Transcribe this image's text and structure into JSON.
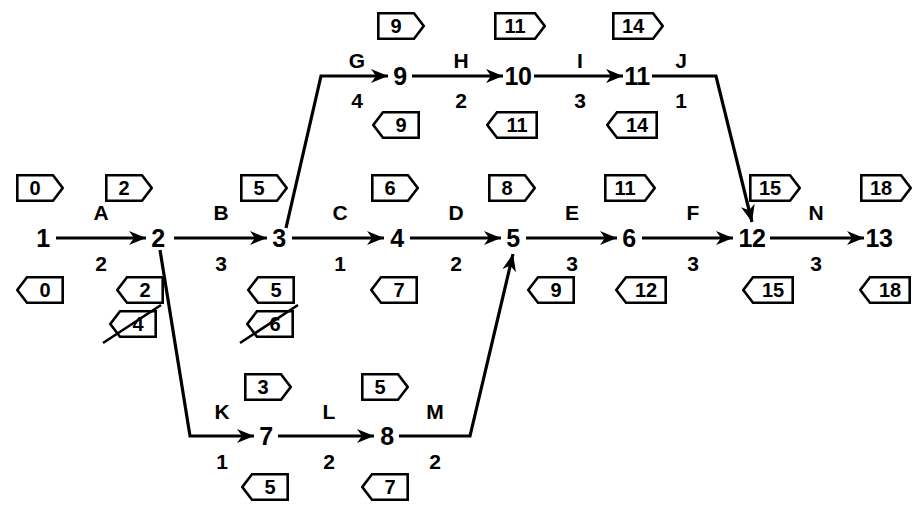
{
  "diagram": {
    "type": "activity-on-arrow-network",
    "colors": {
      "ink": "#000000",
      "paper": "#ffffff"
    }
  },
  "nodes": [
    {
      "id": "n1",
      "label": "1",
      "x": 43,
      "y": 238
    },
    {
      "id": "n2",
      "label": "2",
      "x": 158,
      "y": 238
    },
    {
      "id": "n3",
      "label": "3",
      "x": 279,
      "y": 238
    },
    {
      "id": "n4",
      "label": "4",
      "x": 397,
      "y": 238
    },
    {
      "id": "n5",
      "label": "5",
      "x": 513,
      "y": 238
    },
    {
      "id": "n6",
      "label": "6",
      "x": 629,
      "y": 238
    },
    {
      "id": "n12",
      "label": "12",
      "x": 752,
      "y": 238
    },
    {
      "id": "n13",
      "label": "13",
      "x": 879,
      "y": 238
    },
    {
      "id": "n9",
      "label": "9",
      "x": 400,
      "y": 76
    },
    {
      "id": "n10",
      "label": "10",
      "x": 518,
      "y": 76
    },
    {
      "id": "n11",
      "label": "11",
      "x": 637,
      "y": 76
    },
    {
      "id": "n7",
      "label": "7",
      "x": 266,
      "y": 436
    },
    {
      "id": "n8",
      "label": "8",
      "x": 387,
      "y": 436
    }
  ],
  "activities": [
    {
      "id": "A",
      "name": "A",
      "duration": "2",
      "from": "1",
      "to": "2",
      "name_x": 101,
      "name_y": 212,
      "dur_x": 101,
      "dur_y": 263
    },
    {
      "id": "B",
      "name": "B",
      "duration": "3",
      "from": "2",
      "to": "3",
      "name_x": 221,
      "name_y": 212,
      "dur_x": 221,
      "dur_y": 263
    },
    {
      "id": "C",
      "name": "C",
      "duration": "1",
      "from": "3",
      "to": "4",
      "name_x": 340,
      "name_y": 212,
      "dur_x": 340,
      "dur_y": 263
    },
    {
      "id": "D",
      "name": "D",
      "duration": "2",
      "from": "4",
      "to": "5",
      "name_x": 456,
      "name_y": 212,
      "dur_x": 456,
      "dur_y": 263
    },
    {
      "id": "E",
      "name": "E",
      "duration": "3",
      "from": "5",
      "to": "6",
      "name_x": 572,
      "name_y": 212,
      "dur_x": 572,
      "dur_y": 263
    },
    {
      "id": "F",
      "name": "F",
      "duration": "3",
      "from": "6",
      "to": "12",
      "name_x": 693,
      "name_y": 212,
      "dur_x": 693,
      "dur_y": 263
    },
    {
      "id": "N",
      "name": "N",
      "duration": "3",
      "from": "12",
      "to": "13",
      "name_x": 816,
      "name_y": 212,
      "dur_x": 816,
      "dur_y": 263
    },
    {
      "id": "G",
      "name": "G",
      "duration": "4",
      "from": "3",
      "to": "9",
      "name_x": 357,
      "name_y": 60,
      "dur_x": 357,
      "dur_y": 100
    },
    {
      "id": "H",
      "name": "H",
      "duration": "2",
      "from": "9",
      "to": "10",
      "name_x": 461,
      "name_y": 60,
      "dur_x": 461,
      "dur_y": 100
    },
    {
      "id": "I",
      "name": "I",
      "duration": "3",
      "from": "10",
      "to": "11",
      "name_x": 580,
      "name_y": 60,
      "dur_x": 580,
      "dur_y": 100
    },
    {
      "id": "J",
      "name": "J",
      "duration": "1",
      "from": "11",
      "to": "12",
      "name_x": 681,
      "name_y": 60,
      "dur_x": 681,
      "dur_y": 100
    },
    {
      "id": "K",
      "name": "K",
      "duration": "1",
      "from": "2",
      "to": "7",
      "name_x": 222,
      "name_y": 411,
      "dur_x": 222,
      "dur_y": 461
    },
    {
      "id": "L",
      "name": "L",
      "duration": "2",
      "from": "7",
      "to": "8",
      "name_x": 329,
      "name_y": 411,
      "dur_x": 329,
      "dur_y": 461
    },
    {
      "id": "M",
      "name": "M",
      "duration": "2",
      "from": "8",
      "to": "5",
      "name_x": 435,
      "name_y": 411,
      "dur_x": 435,
      "dur_y": 461
    }
  ],
  "tags": [
    {
      "id": "t-e1",
      "value": "0",
      "dir": "forward",
      "struck": false,
      "x": 40,
      "y": 188,
      "w": 48,
      "h": 28
    },
    {
      "id": "t-e2",
      "value": "2",
      "dir": "forward",
      "struck": false,
      "x": 129,
      "y": 188,
      "w": 48,
      "h": 28
    },
    {
      "id": "t-e3",
      "value": "5",
      "dir": "forward",
      "struck": false,
      "x": 264,
      "y": 188,
      "w": 48,
      "h": 28
    },
    {
      "id": "t-e4",
      "value": "6",
      "dir": "forward",
      "struck": false,
      "x": 395,
      "y": 188,
      "w": 48,
      "h": 28
    },
    {
      "id": "t-e5",
      "value": "8",
      "dir": "forward",
      "struck": false,
      "x": 512,
      "y": 188,
      "w": 48,
      "h": 28
    },
    {
      "id": "t-e6",
      "value": "11",
      "dir": "forward",
      "struck": false,
      "x": 630,
      "y": 188,
      "w": 52,
      "h": 28
    },
    {
      "id": "t-e12",
      "value": "15",
      "dir": "forward",
      "struck": false,
      "x": 775,
      "y": 188,
      "w": 52,
      "h": 28
    },
    {
      "id": "t-e13",
      "value": "18",
      "dir": "forward",
      "struck": false,
      "x": 886,
      "y": 188,
      "w": 52,
      "h": 28
    },
    {
      "id": "t-l1",
      "value": "0",
      "dir": "backward",
      "struck": false,
      "x": 40,
      "y": 290,
      "w": 48,
      "h": 28
    },
    {
      "id": "t-l2",
      "value": "2",
      "dir": "backward",
      "struck": false,
      "x": 140,
      "y": 290,
      "w": 48,
      "h": 28
    },
    {
      "id": "t-l3",
      "value": "5",
      "dir": "backward",
      "struck": false,
      "x": 271,
      "y": 290,
      "w": 48,
      "h": 28
    },
    {
      "id": "t-l4",
      "value": "7",
      "dir": "backward",
      "struck": false,
      "x": 394,
      "y": 290,
      "w": 48,
      "h": 28
    },
    {
      "id": "t-l5",
      "value": "9",
      "dir": "backward",
      "struck": false,
      "x": 551,
      "y": 290,
      "w": 48,
      "h": 28
    },
    {
      "id": "t-l6",
      "value": "12",
      "dir": "backward",
      "struck": false,
      "x": 641,
      "y": 290,
      "w": 52,
      "h": 28
    },
    {
      "id": "t-l12",
      "value": "15",
      "dir": "backward",
      "struck": false,
      "x": 768,
      "y": 290,
      "w": 52,
      "h": 28
    },
    {
      "id": "t-l13",
      "value": "18",
      "dir": "backward",
      "struck": false,
      "x": 885,
      "y": 290,
      "w": 52,
      "h": 28
    },
    {
      "id": "t-l2x",
      "value": "4",
      "dir": "backward",
      "struck": true,
      "x": 133,
      "y": 324,
      "w": 48,
      "h": 28
    },
    {
      "id": "t-l3x",
      "value": "6",
      "dir": "backward",
      "struck": true,
      "x": 270,
      "y": 324,
      "w": 48,
      "h": 28
    },
    {
      "id": "t-e9",
      "value": "9",
      "dir": "forward",
      "struck": false,
      "x": 401,
      "y": 26,
      "w": 48,
      "h": 28
    },
    {
      "id": "t-e10",
      "value": "11",
      "dir": "forward",
      "struck": false,
      "x": 520,
      "y": 26,
      "w": 52,
      "h": 28
    },
    {
      "id": "t-e11",
      "value": "14",
      "dir": "forward",
      "struck": false,
      "x": 638,
      "y": 26,
      "w": 52,
      "h": 28
    },
    {
      "id": "t-l9",
      "value": "9",
      "dir": "backward",
      "struck": false,
      "x": 396,
      "y": 125,
      "w": 48,
      "h": 28
    },
    {
      "id": "t-l10",
      "value": "11",
      "dir": "backward",
      "struck": false,
      "x": 512,
      "y": 125,
      "w": 52,
      "h": 28
    },
    {
      "id": "t-l11",
      "value": "14",
      "dir": "backward",
      "struck": false,
      "x": 632,
      "y": 125,
      "w": 52,
      "h": 28
    },
    {
      "id": "t-e7",
      "value": "3",
      "dir": "forward",
      "struck": false,
      "x": 268,
      "y": 387,
      "w": 48,
      "h": 28
    },
    {
      "id": "t-e8",
      "value": "5",
      "dir": "forward",
      "struck": false,
      "x": 385,
      "y": 387,
      "w": 48,
      "h": 28
    },
    {
      "id": "t-l7",
      "value": "5",
      "dir": "backward",
      "struck": false,
      "x": 265,
      "y": 487,
      "w": 48,
      "h": 28
    },
    {
      "id": "t-l8",
      "value": "7",
      "dir": "backward",
      "struck": false,
      "x": 385,
      "y": 487,
      "w": 48,
      "h": 28
    }
  ],
  "edges": [
    {
      "id": "e-A",
      "path": "M 56 238 L 146 238",
      "arrow": true,
      "arrow_at": [
        146,
        238
      ],
      "angle": 0
    },
    {
      "id": "e-B",
      "path": "M 174 238 L 267 238",
      "arrow": true,
      "arrow_at": [
        267,
        238
      ],
      "angle": 0
    },
    {
      "id": "e-C",
      "path": "M 292 238 L 384 238",
      "arrow": true,
      "arrow_at": [
        384,
        238
      ],
      "angle": 0
    },
    {
      "id": "e-D",
      "path": "M 410 238 L 501 238",
      "arrow": true,
      "arrow_at": [
        501,
        238
      ],
      "angle": 0
    },
    {
      "id": "e-E",
      "path": "M 526 238 L 617 238",
      "arrow": true,
      "arrow_at": [
        617,
        238
      ],
      "angle": 0
    },
    {
      "id": "e-F",
      "path": "M 642 238 L 733 238",
      "arrow": true,
      "arrow_at": [
        733,
        238
      ],
      "angle": 0
    },
    {
      "id": "e-N",
      "path": "M 770 238 L 864 238",
      "arrow": true,
      "arrow_at": [
        864,
        238
      ],
      "angle": 0
    },
    {
      "id": "e-G",
      "path": "M 286 228 L 321 76 L 388 76",
      "arrow": true,
      "arrow_at": [
        388,
        76
      ],
      "angle": 0
    },
    {
      "id": "e-H",
      "path": "M 412 76 L 503 76",
      "arrow": true,
      "arrow_at": [
        503,
        76
      ],
      "angle": 0
    },
    {
      "id": "e-I",
      "path": "M 534 76 L 623 76",
      "arrow": true,
      "arrow_at": [
        623,
        76
      ],
      "angle": 0
    },
    {
      "id": "e-J",
      "path": "M 652 76 L 716 76 L 752 222",
      "arrow": true,
      "arrow_at": [
        752,
        222
      ],
      "angle": 76
    },
    {
      "id": "e-K",
      "path": "M 160 250 L 190 436 L 254 436",
      "arrow": true,
      "arrow_at": [
        254,
        436
      ],
      "angle": 0
    },
    {
      "id": "e-L",
      "path": "M 278 436 L 374 436",
      "arrow": true,
      "arrow_at": [
        374,
        436
      ],
      "angle": 0
    },
    {
      "id": "e-M",
      "path": "M 399 436 L 470 436 L 513 254",
      "arrow": true,
      "arrow_at": [
        513,
        254
      ],
      "angle": -77
    }
  ]
}
